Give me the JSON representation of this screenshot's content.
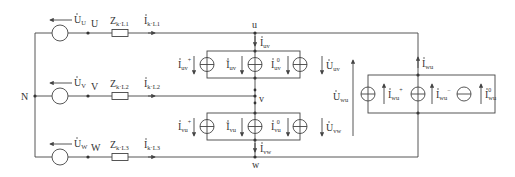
{
  "diagram": {
    "type": "three-phase-circuit",
    "neutral_label": "N",
    "phases": [
      {
        "node": "U",
        "source_voltage": "U",
        "source_sub": "U",
        "impedance": "Z",
        "impedance_sub": "k·L1",
        "current": "I",
        "current_sub": "k·L1"
      },
      {
        "node": "V",
        "source_voltage": "U",
        "source_sub": "V",
        "impedance": "Z",
        "impedance_sub": "k·L2",
        "current": "I",
        "current_sub": "k·L2"
      },
      {
        "node": "W",
        "source_voltage": "U",
        "source_sub": "W",
        "impedance": "Z",
        "impedance_sub": "k·L3",
        "current": "I",
        "current_sub": "k·L3"
      }
    ],
    "load_nodes": [
      "u",
      "v",
      "w"
    ],
    "branches": {
      "uv": {
        "current": "I",
        "current_sub": "uv",
        "sources": [
          {
            "sub": "uv",
            "sup": "+"
          },
          {
            "sub": "uv",
            "sup": "−"
          },
          {
            "sub": "uv",
            "sup": "0"
          }
        ],
        "voltage": "U",
        "voltage_sub": "uv"
      },
      "vu": {
        "sources": [
          {
            "sub": "vu",
            "sup": "+"
          },
          {
            "sub": "vu",
            "sup": "−"
          },
          {
            "sub": "vu",
            "sup": "0"
          }
        ],
        "voltage": "U",
        "voltage_sub": "vw"
      },
      "vw_current": {
        "current": "I",
        "current_sub": "vw"
      },
      "wu": {
        "current": "I",
        "current_sub": "wu",
        "sources": [
          {
            "sub": "wu",
            "sup": "+"
          },
          {
            "sub": "wu",
            "sup": "−"
          },
          {
            "sub": "wu",
            "sup": "0"
          }
        ],
        "voltage": "U",
        "voltage_sub": "wu"
      }
    },
    "line_color": "#444444",
    "text_color": "#333333"
  }
}
